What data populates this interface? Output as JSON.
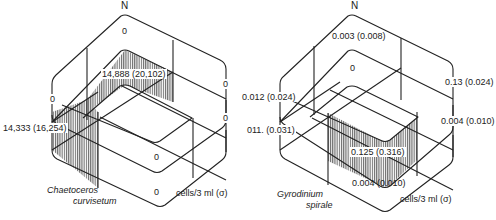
{
  "diagrams": [
    {
      "species": "Chaetoceros curvisetum",
      "species_line1": "Chaetoceros",
      "species_line2": "curvisetum",
      "north": "N",
      "units": "cells/3 ml (σ)",
      "values": {
        "top_layer": "0",
        "middle_layer_hatched": "14,888 (20,102)",
        "left_side_upper": "0",
        "left_side_hatched": "14,333 (16,254)",
        "right_side_upper": "0",
        "right_side_lower": "0",
        "middle_lower": "0",
        "bottom_layer": "0"
      }
    },
    {
      "species": "Gyrodinium spirale",
      "species_line1": "Gyrodinium",
      "species_line2": "spirale",
      "north": "N",
      "units": "cells/3 ml (σ)",
      "values": {
        "top_layer": "0.003 (0.008)",
        "middle_layer": "0",
        "left_side_upper": "0.012 (0.024)",
        "left_side_lower": "011. (0.031)",
        "right_side_upper": "0.13 (0.024)",
        "right_side_lower": "0.004 (0.010)",
        "middle_lower_hatched": "0.125 (0.316)",
        "bottom_layer": "0.004 (0.010)"
      }
    }
  ]
}
